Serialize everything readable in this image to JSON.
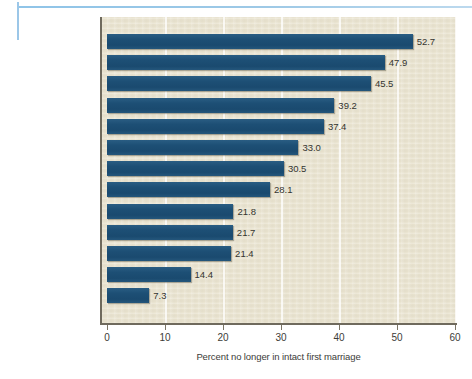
{
  "figure": {
    "background_color": "#ffffff",
    "plot_background_color": "#e9e3cf",
    "bar_color": "#1d4f75",
    "axis_color": "#6f6a5d",
    "rule_color": "#9cc7e8"
  },
  "chart_data": {
    "type": "bar",
    "orientation": "horizontal",
    "title": "",
    "subtitle": "",
    "xlabel": "Percent no longer in intact first marriage",
    "ylabel": "",
    "xlim": [
      0,
      60
    ],
    "xticks": [
      "0",
      "10",
      "20",
      "30",
      "40",
      "50",
      "60"
    ],
    "xtick_values": [
      0,
      10,
      20,
      30,
      40,
      50,
      60
    ],
    "grid": "vertical-white-gridlines",
    "legend": "none",
    "categories": [
      "African American",
      "Native American",
      "Puerto Rican",
      "Hawaiian",
      "Non-Hispanic White",
      "Cuban",
      "Mexican",
      "Vietnamese",
      "Japanese",
      "Korean",
      "Filipino",
      "Chinese",
      "Asian Indian"
    ],
    "values": [
      52.7,
      47.9,
      45.5,
      39.2,
      37.4,
      33.0,
      30.5,
      28.1,
      21.8,
      21.7,
      21.4,
      14.4,
      7.3
    ],
    "value_labels": [
      "52.7",
      "47.9",
      "45.5",
      "39.2",
      "37.4",
      "33.0",
      "30.5",
      "28.1",
      "21.8",
      "21.7",
      "21.4",
      "14.4",
      "7.3"
    ]
  }
}
